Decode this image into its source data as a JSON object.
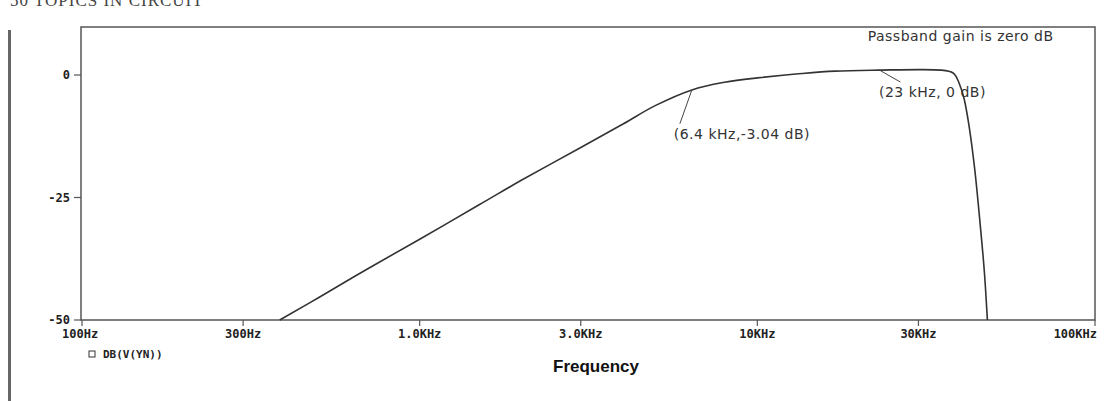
{
  "page": {
    "header_fragment": "50   TOPICS IN CIRCUIT"
  },
  "chart_data": {
    "type": "line",
    "title": "",
    "xlabel": "Frequency",
    "ylabel": "",
    "xscale": "log",
    "xlim": [
      100,
      100000
    ],
    "ylim": [
      -50,
      10
    ],
    "grid": false,
    "x_ticks": [
      {
        "value": 100,
        "label": "100Hz"
      },
      {
        "value": 300,
        "label": "300Hz"
      },
      {
        "value": 1000,
        "label": "1.0KHz"
      },
      {
        "value": 3000,
        "label": "3.0KHz"
      },
      {
        "value": 10000,
        "label": "10KHz"
      },
      {
        "value": 30000,
        "label": "30KHz"
      },
      {
        "value": 100000,
        "label": "100KHz"
      }
    ],
    "y_ticks": [
      {
        "value": 0,
        "label": "0"
      },
      {
        "value": -25,
        "label": "-25"
      },
      {
        "value": -50,
        "label": "-50"
      }
    ],
    "legend": {
      "placement": "bottom-left",
      "entries": [
        {
          "marker": "square",
          "label": "DB(V(YN))"
        }
      ]
    },
    "series": [
      {
        "name": "DB(V(YN))",
        "x": [
          385,
          500,
          700,
          1000,
          1500,
          2000,
          3000,
          4000,
          5000,
          6400,
          8000,
          10000,
          13000,
          17000,
          23000,
          30000,
          35000,
          38000,
          39500,
          41000,
          42500,
          44000,
          45500,
          47000,
          48000
        ],
        "y": [
          -50,
          -45.5,
          -39.6,
          -33.5,
          -26.5,
          -21.5,
          -14.8,
          -10,
          -6.2,
          -3.04,
          -1.5,
          -0.6,
          0.2,
          0.8,
          1.0,
          1.1,
          1.0,
          0.4,
          -1.5,
          -5,
          -11,
          -19,
          -29,
          -40,
          -50
        ]
      }
    ],
    "annotations": [
      {
        "text": "Passband gain is zero dB",
        "x": 40000,
        "y": 7,
        "pointer": null
      },
      {
        "text": "(23 kHz, 0 dB)",
        "label_x": 33000,
        "label_y": -4.5,
        "pointer": {
          "x": 23000,
          "y": 1.0
        }
      },
      {
        "text": "(6.4 kHz,-3.04 dB)",
        "label_x": 9000,
        "label_y": -13,
        "pointer": {
          "x": 6400,
          "y": -3.04
        }
      }
    ]
  }
}
